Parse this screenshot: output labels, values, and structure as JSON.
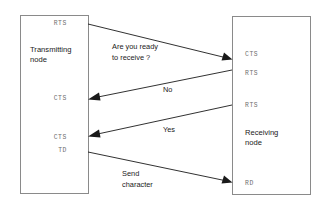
{
  "diagram": {
    "background_color": "#ffffff",
    "line_color": "#1a1a1a",
    "box_border_color": "#8a8a8a",
    "signal_text_color": "#6f6f6f",
    "nodes": [
      {
        "id": "transmitting",
        "title_line1": "Transmitting",
        "title_line2": "node",
        "signals": [
          {
            "id": "tx-rts-top",
            "label": "RTS"
          },
          {
            "id": "tx-cts-mid",
            "label": "CTS"
          },
          {
            "id": "tx-cts-low",
            "label": "CTS"
          },
          {
            "id": "tx-td",
            "label": "TD"
          }
        ]
      },
      {
        "id": "receiving",
        "title_line1": "Receiving",
        "title_line2": "node",
        "signals": [
          {
            "id": "rx-cts",
            "label": "CTS"
          },
          {
            "id": "rx-rts-upper",
            "label": "RTS"
          },
          {
            "id": "rx-rts-lower",
            "label": "RTS"
          },
          {
            "id": "rx-rd",
            "label": "RD"
          }
        ]
      }
    ],
    "messages": [
      {
        "id": "msg-are-you-ready",
        "line1": "Are you ready",
        "line2": "to receive ?",
        "direction": "left-to-right"
      },
      {
        "id": "msg-no",
        "line1": "No",
        "line2": "",
        "direction": "right-to-left"
      },
      {
        "id": "msg-yes",
        "line1": "Yes",
        "line2": "",
        "direction": "right-to-left"
      },
      {
        "id": "msg-send-character",
        "line1": "Send",
        "line2": "character",
        "direction": "left-to-right"
      }
    ]
  }
}
